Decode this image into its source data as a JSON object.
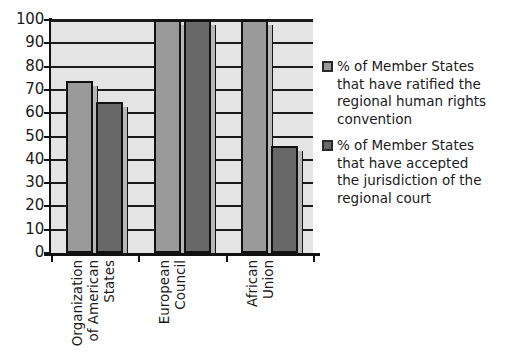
{
  "chart_data": {
    "type": "bar",
    "title": "",
    "subtitle": "",
    "xlabel": "",
    "ylabel": "",
    "ylim": [
      0,
      100
    ],
    "ytick_step": 10,
    "yticks": [
      100,
      90,
      80,
      70,
      60,
      50,
      40,
      30,
      20,
      10,
      0
    ],
    "grid": true,
    "grid_orientation": "horizontal",
    "legend_position": "right",
    "orientation": "vertical",
    "categories": [
      "Organization of American States",
      "European Council",
      "African Union"
    ],
    "category_label_lines": [
      [
        "Organization",
        "of American",
        "States"
      ],
      [
        "European",
        "Council"
      ],
      [
        "African",
        "Union"
      ]
    ],
    "series": [
      {
        "name": "% of Member States that have ratified the regional human rights convention",
        "name_lines": [
          "% of Member States",
          "that have ratified the",
          "regional human rights",
          "convention"
        ],
        "color": "#9a9a9a",
        "values": [
          74,
          100,
          100
        ]
      },
      {
        "name": "% of Member States that have accepted the jurisdiction of the regional court",
        "name_lines": [
          "% of Member States",
          "that have accepted",
          "the jurisdiction of the",
          "regional court"
        ],
        "color": "#686868",
        "values": [
          65,
          100,
          46
        ]
      }
    ],
    "colors": {
      "series_1": "#9a9a9a",
      "series_2": "#686868",
      "plot_background": "#e4e4e4",
      "gridline": "#1b1b1b",
      "axis": "#111111",
      "bar_outline": "#111111",
      "text": "#1a1a1a",
      "page_background": "#ffffff"
    }
  }
}
